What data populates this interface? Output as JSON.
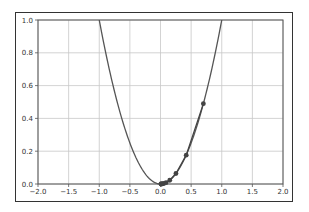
{
  "chart_data": {
    "type": "line",
    "title": "",
    "xlabel": "",
    "ylabel": "",
    "xlim": [
      -2.0,
      2.0
    ],
    "ylim": [
      0.0,
      1.0
    ],
    "grid": true,
    "legend": null,
    "x_ticks": [
      "−2.0",
      "−1.5",
      "−1.0",
      "−0.5",
      "0.0",
      "0.5",
      "1.0",
      "1.5",
      "2.0"
    ],
    "y_ticks": [
      "0.0",
      "0.2",
      "0.4",
      "0.6",
      "0.8",
      "1.0"
    ],
    "series": [
      {
        "name": "f(x) = x^2",
        "kind": "line",
        "color": "#555555",
        "function": "x^2",
        "x_range": [
          -2.0,
          2.0
        ]
      },
      {
        "name": "descent steps",
        "kind": "line+markers",
        "color": "#444444",
        "x": [
          0.7,
          0.42,
          0.252,
          0.151,
          0.091,
          0.054,
          0.033,
          0.02,
          0.012,
          0.007
        ],
        "y": [
          0.49,
          0.176,
          0.064,
          0.023,
          0.008,
          0.003,
          0.001,
          0.0004,
          0.0001,
          0.0
        ]
      }
    ]
  }
}
